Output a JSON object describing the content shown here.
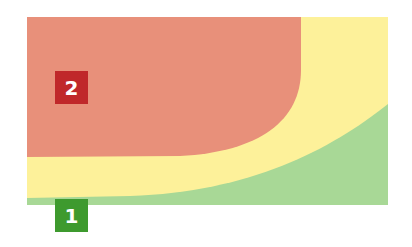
{
  "diagram": {
    "zones": [
      {
        "id": "red",
        "color": "#e8907a"
      },
      {
        "id": "yellow",
        "color": "#fdf19a"
      },
      {
        "id": "green",
        "color": "#a8d896"
      }
    ],
    "labels": [
      {
        "text": "2",
        "color": "#c0282a"
      },
      {
        "text": "1",
        "color": "#3e9a2e"
      }
    ]
  }
}
